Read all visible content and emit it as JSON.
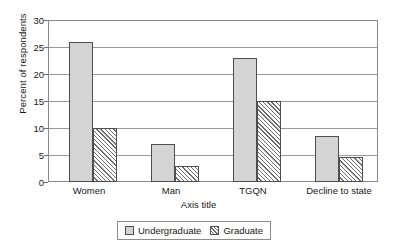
{
  "chart_data": {
    "type": "bar",
    "title": "",
    "xlabel": "Axis title",
    "ylabel": "Percent of respondents",
    "categories": [
      "Women",
      "Man",
      "TGQN",
      "Decline to state"
    ],
    "series": [
      {
        "name": "Undergraduate",
        "values": [
          26,
          7,
          23,
          8.6
        ]
      },
      {
        "name": "Graduate",
        "values": [
          10,
          3,
          15,
          4.7
        ]
      }
    ],
    "ylim": [
      0,
      30
    ],
    "yticks": [
      0,
      5,
      10,
      15,
      20,
      25,
      30
    ],
    "ytick_labels": [
      "0",
      "5",
      "10",
      "15",
      "20",
      "25",
      "30"
    ],
    "grid": true,
    "legend_position": "bottom-center",
    "colors": {
      "undergraduate": "#d4d4d4",
      "graduate_hatch": "#6d6d6d",
      "axis": "#8a8a8a",
      "gridline": "#9a9a9a",
      "text": "#171717"
    }
  },
  "axes": {
    "y_title": "Percent of respondents",
    "x_title": "Axis title"
  },
  "legend": {
    "items": [
      {
        "label": "Undergraduate",
        "style": "solid-gray"
      },
      {
        "label": "Graduate",
        "style": "diagonal-hatch"
      }
    ]
  },
  "ticks": {
    "y": [
      "30",
      "25",
      "20",
      "15",
      "10",
      "5",
      "0"
    ],
    "x": [
      "Women",
      "Man",
      "TGQN",
      "Decline to state"
    ]
  }
}
